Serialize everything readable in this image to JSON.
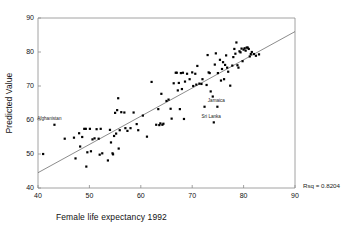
{
  "chart_data": {
    "type": "scatter",
    "title": "",
    "xlabel": "Female life expectancy 1992",
    "ylabel": "Predicted Value",
    "xlim": [
      40,
      90
    ],
    "ylim": [
      40,
      90
    ],
    "xticks": [
      40,
      50,
      60,
      70,
      80,
      90
    ],
    "yticks": [
      40,
      50,
      60,
      70,
      80,
      90
    ],
    "grid": false,
    "legend": null,
    "marker": "square",
    "marker_color": "#000000",
    "frame_color": "#8a8a8a",
    "annotations": [
      {
        "text": "Afghanistan",
        "x": 43.2,
        "y": 58.6,
        "label_dx": -1.0,
        "label_dy": 1.3
      },
      {
        "text": "Jamaica",
        "x": 74.9,
        "y": 63.9,
        "label_dx": -0.2,
        "label_dy": 1.3
      },
      {
        "text": "Sri Lanka",
        "x": 74.2,
        "y": 59.3,
        "label_dx": -0.5,
        "label_dy": 1.3
      }
    ],
    "corner_text": "Rsq = 0.8204",
    "fit_line": {
      "type": "linear",
      "x_start": 40.0,
      "y_start": 44.5,
      "x_end": 90.0,
      "y_end": 86.0,
      "color": "#5a5a5a"
    },
    "series": [
      {
        "name": "countries",
        "points": [
          [
            41.0,
            50.0
          ],
          [
            43.2,
            58.6
          ],
          [
            45.2,
            54.5
          ],
          [
            47.0,
            54.8
          ],
          [
            47.3,
            48.7
          ],
          [
            48.0,
            56.1
          ],
          [
            48.2,
            52.2
          ],
          [
            48.6,
            55.0
          ],
          [
            49.0,
            57.4
          ],
          [
            49.3,
            57.4
          ],
          [
            49.4,
            46.3
          ],
          [
            49.6,
            50.5
          ],
          [
            50.1,
            57.4
          ],
          [
            50.3,
            50.8
          ],
          [
            50.6,
            54.3
          ],
          [
            51.0,
            54.6
          ],
          [
            51.4,
            57.3
          ],
          [
            51.8,
            54.5
          ],
          [
            52.0,
            49.8
          ],
          [
            52.2,
            57.4
          ],
          [
            52.5,
            50.2
          ],
          [
            53.6,
            48.1
          ],
          [
            54.0,
            57.1
          ],
          [
            54.2,
            53.4
          ],
          [
            54.5,
            50.2
          ],
          [
            54.6,
            49.9
          ],
          [
            54.8,
            55.3
          ],
          [
            55.0,
            62.1
          ],
          [
            55.2,
            56.0
          ],
          [
            55.4,
            62.9
          ],
          [
            55.6,
            66.4
          ],
          [
            55.7,
            51.6
          ],
          [
            55.9,
            57.0
          ],
          [
            56.2,
            62.3
          ],
          [
            56.8,
            62.2
          ],
          [
            57.0,
            57.6
          ],
          [
            57.4,
            56.8
          ],
          [
            58.0,
            57.6
          ],
          [
            58.6,
            62.2
          ],
          [
            59.2,
            58.8
          ],
          [
            59.5,
            57.0
          ],
          [
            60.4,
            61.3
          ],
          [
            61.2,
            55.1
          ],
          [
            62.1,
            71.2
          ],
          [
            63.0,
            58.6
          ],
          [
            63.4,
            63.2
          ],
          [
            63.6,
            58.5
          ],
          [
            63.8,
            59.0
          ],
          [
            64.0,
            67.7
          ],
          [
            64.2,
            58.6
          ],
          [
            64.4,
            58.9
          ],
          [
            65.0,
            65.6
          ],
          [
            65.4,
            66.0
          ],
          [
            65.8,
            63.3
          ],
          [
            66.0,
            60.4
          ],
          [
            66.4,
            70.8
          ],
          [
            66.8,
            73.9
          ],
          [
            67.0,
            73.9
          ],
          [
            67.2,
            68.7
          ],
          [
            67.4,
            70.9
          ],
          [
            67.6,
            63.2
          ],
          [
            67.8,
            73.8
          ],
          [
            68.0,
            69.1
          ],
          [
            68.2,
            73.9
          ],
          [
            68.4,
            60.3
          ],
          [
            68.6,
            71.3
          ],
          [
            69.0,
            73.6
          ],
          [
            69.5,
            72.0
          ],
          [
            70.0,
            74.0
          ],
          [
            70.2,
            70.0
          ],
          [
            70.6,
            73.6
          ],
          [
            70.8,
            70.4
          ],
          [
            71.0,
            75.9
          ],
          [
            71.4,
            70.7
          ],
          [
            71.8,
            70.6
          ],
          [
            72.0,
            72.0
          ],
          [
            72.4,
            63.9
          ],
          [
            72.8,
            70.3
          ],
          [
            73.0,
            79.1
          ],
          [
            73.2,
            74.0
          ],
          [
            73.4,
            73.8
          ],
          [
            73.6,
            68.4
          ],
          [
            74.0,
            66.9
          ],
          [
            74.2,
            59.3
          ],
          [
            74.4,
            76.3
          ],
          [
            74.6,
            79.6
          ],
          [
            74.9,
            63.9
          ],
          [
            75.0,
            73.8
          ],
          [
            75.4,
            77.7
          ],
          [
            75.6,
            71.6
          ],
          [
            75.8,
            75.0
          ],
          [
            76.0,
            77.0
          ],
          [
            76.2,
            72.0
          ],
          [
            76.4,
            76.2
          ],
          [
            76.6,
            79.0
          ],
          [
            76.8,
            75.4
          ],
          [
            77.0,
            74.2
          ],
          [
            77.4,
            70.1
          ],
          [
            77.8,
            76.0
          ],
          [
            78.0,
            78.5
          ],
          [
            78.2,
            80.9
          ],
          [
            78.4,
            79.5
          ],
          [
            78.6,
            82.8
          ],
          [
            78.8,
            76.1
          ],
          [
            79.0,
            75.4
          ],
          [
            79.2,
            80.2
          ],
          [
            79.4,
            79.9
          ],
          [
            79.6,
            81.0
          ],
          [
            79.8,
            77.3
          ],
          [
            80.0,
            80.7
          ],
          [
            80.2,
            81.1
          ],
          [
            80.4,
            80.4
          ],
          [
            80.6,
            81.3
          ],
          [
            80.8,
            81.3
          ],
          [
            81.0,
            80.9
          ],
          [
            81.2,
            78.7
          ],
          [
            81.4,
            79.4
          ],
          [
            81.6,
            80.0
          ],
          [
            82.0,
            79.4
          ],
          [
            82.4,
            78.9
          ],
          [
            83.0,
            79.3
          ]
        ]
      }
    ]
  }
}
